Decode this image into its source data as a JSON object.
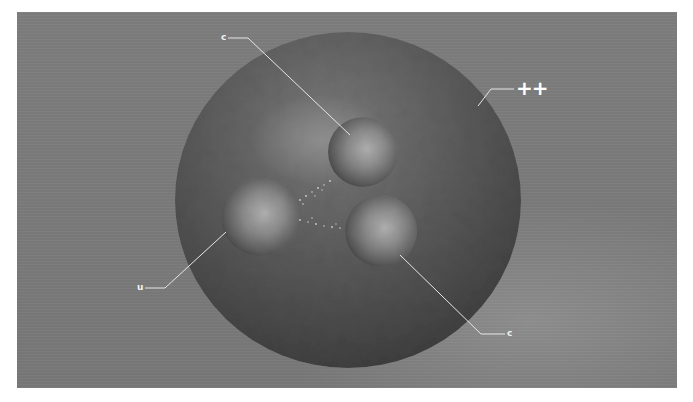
{
  "scene": {
    "title": "Doubly charmed baryon illustration",
    "background_color": "#7b7b7b",
    "frame": {
      "x": 17,
      "y": 12,
      "width": 660,
      "height": 376
    }
  },
  "particle": {
    "charge_label": "++",
    "outer_sphere": {
      "cx": 348,
      "cy": 200,
      "rx": 173,
      "ry": 168,
      "color": "#555555"
    }
  },
  "quarks": [
    {
      "label": "c",
      "name": "charm-quark-top",
      "cx": 363,
      "cy": 152,
      "r": 35
    },
    {
      "label": "u",
      "name": "up-quark",
      "cx": 260,
      "cy": 217,
      "r": 39
    },
    {
      "label": "c",
      "name": "charm-quark-bottom",
      "cx": 381,
      "cy": 231,
      "r": 36
    }
  ],
  "labels": {
    "top_c": "c",
    "u": "u",
    "bottom_c": "c",
    "charge": "++"
  }
}
